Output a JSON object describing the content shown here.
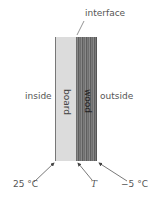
{
  "diagram": {
    "labels": {
      "interface": "interface",
      "inside": "inside",
      "outside": "outside",
      "board": "board",
      "wood": "wood"
    },
    "temperatures": {
      "inside": "25 °C",
      "interface": "T",
      "outside": "−5 °C"
    },
    "colors": {
      "board": "#dcdcdc",
      "wood": "#707070",
      "line": "#555555"
    }
  }
}
